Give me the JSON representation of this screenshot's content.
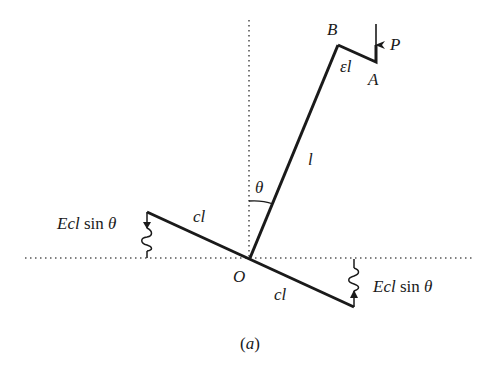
{
  "figure": {
    "caption": "(a)",
    "labels": {
      "B": "B",
      "A": "A",
      "P": "P",
      "eps_l": "εl",
      "l": "l",
      "theta": "θ",
      "O": "O",
      "cl_left": "cl",
      "cl_right": "cl",
      "spring_left_E": "Ecl",
      "spring_left_sin": " sin ",
      "spring_left_theta": "θ",
      "spring_right_E": "Ecl",
      "spring_right_sin": " sin ",
      "spring_right_theta": "θ"
    },
    "colors": {
      "ink": "#1a1a1a",
      "dotted": "#555555",
      "background": "#ffffff"
    }
  }
}
